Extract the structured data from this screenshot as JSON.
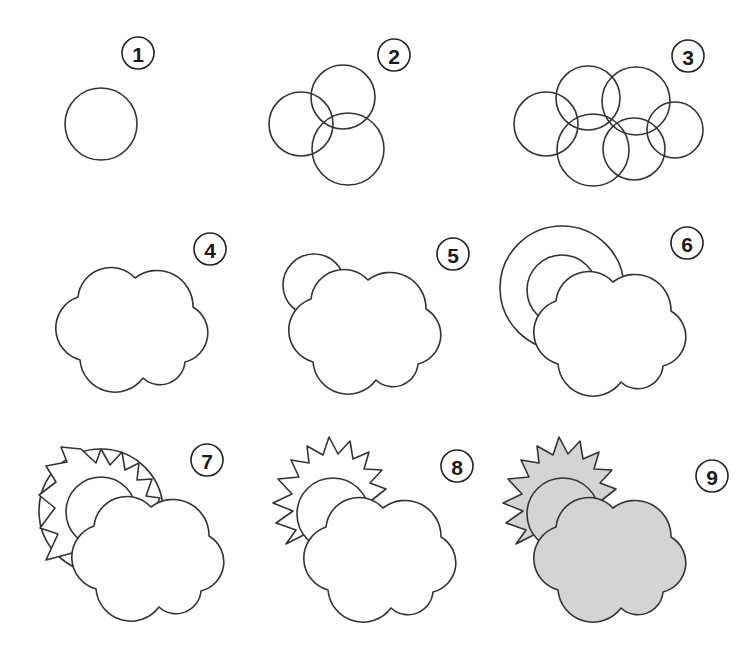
{
  "colors": {
    "stroke": "#333333",
    "fill_final": "#d4d4d4",
    "background": "#ffffff"
  },
  "steps": [
    {
      "number": "1",
      "description": "Draw one circle"
    },
    {
      "number": "2",
      "description": "Add two overlapping circles"
    },
    {
      "number": "3",
      "description": "Add more circles to form the cloud base"
    },
    {
      "number": "4",
      "description": "Trace the outer outline of the cloud"
    },
    {
      "number": "5",
      "description": "Draw a half circle behind the cloud"
    },
    {
      "number": "6",
      "description": "Add a larger arc around it"
    },
    {
      "number": "7",
      "description": "Draw zig-zag rays between the arcs"
    },
    {
      "number": "8",
      "description": "Erase the outer arc leaving sun rays"
    },
    {
      "number": "9",
      "description": "Color the cloud and sun grey"
    }
  ]
}
